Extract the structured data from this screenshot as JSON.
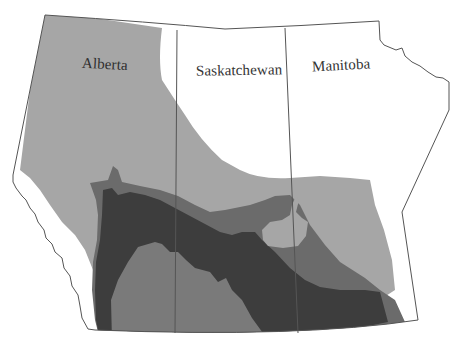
{
  "map": {
    "title": "",
    "region": "Canadian Prairie Provinces",
    "provinces": [
      {
        "key": "alberta",
        "label": "Alberta"
      },
      {
        "key": "saskatchewan",
        "label": "Saskatchewan"
      },
      {
        "key": "manitoba",
        "label": "Manitoba"
      }
    ],
    "shading_levels": [
      {
        "level": 1,
        "color": "#a6a6a6",
        "description": "light gray (outer zone)"
      },
      {
        "level": 2,
        "color": "#6b6b6b",
        "description": "medium-dark gray"
      },
      {
        "level": 3,
        "color": "#3d3d3d",
        "description": "darkest gray (core band)"
      },
      {
        "level": 4,
        "color": "#7a7a7a",
        "description": "medium gray (southern interior)"
      }
    ],
    "colors": {
      "background": "#ffffff",
      "border": "#555555",
      "unshaded": "#ffffff"
    }
  }
}
